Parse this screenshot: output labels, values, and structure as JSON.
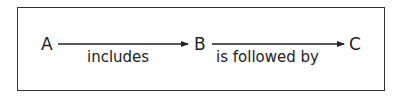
{
  "diagram": {
    "nodes": [
      {
        "id": "A",
        "label": "A"
      },
      {
        "id": "B",
        "label": "B"
      },
      {
        "id": "C",
        "label": "C"
      }
    ],
    "edges": [
      {
        "from": "A",
        "to": "B",
        "label": "includes"
      },
      {
        "from": "B",
        "to": "C",
        "label": "is followed by"
      }
    ],
    "colors": {
      "stroke": "#222222",
      "background": "#ffffff"
    }
  }
}
